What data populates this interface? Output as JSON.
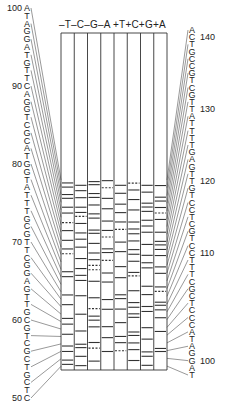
{
  "header": {
    "lane_labels": [
      "-T",
      "-C",
      "-G",
      "-A",
      "+T",
      "+C",
      "+G",
      "+A"
    ],
    "text": "–T–C–G–A +T+C+G+A"
  },
  "left_sequence": {
    "start_position": 100,
    "end_position": 50,
    "bases": [
      "A",
      "T",
      "A",
      "G",
      "G",
      "A",
      "T",
      "G",
      "T",
      "T",
      "C",
      "A",
      "G",
      "G",
      "T",
      "C",
      "G",
      "C",
      "A",
      "T",
      "G",
      "G",
      "T",
      "A",
      "T",
      "T",
      "T",
      "G",
      "C",
      "G",
      "T",
      "T",
      "C",
      "G",
      "G",
      "A",
      "G",
      "T",
      "T",
      "G",
      "C",
      "G",
      "T",
      "C",
      "G",
      "C",
      "T",
      "G",
      "C",
      "T",
      "C"
    ],
    "labels": [
      {
        "text": "100",
        "index": 0
      },
      {
        "text": "90",
        "index": 10
      },
      {
        "text": "80",
        "index": 20
      },
      {
        "text": "70",
        "index": 30
      },
      {
        "text": "60",
        "index": 40
      },
      {
        "text": "50",
        "index": 50
      }
    ]
  },
  "right_sequence": {
    "start_position": 141,
    "end_position": 97,
    "bases": [
      "A",
      "C",
      "T",
      "G",
      "C",
      "C",
      "G",
      "T",
      "C",
      "G",
      "T",
      "T",
      "A",
      "T",
      "T",
      "T",
      "T",
      "G",
      "A",
      "G",
      "T",
      "T",
      "G",
      "T",
      "C",
      "C",
      "T",
      "C",
      "G",
      "T",
      "C",
      "C",
      "T",
      "T",
      "T",
      "C",
      "G",
      "C",
      "T",
      "C",
      "C",
      "C",
      "A",
      "T",
      "A",
      "G",
      "G",
      "A",
      "T"
    ],
    "labels": [
      {
        "text": "140",
        "index": 1
      },
      {
        "text": "130",
        "index": 11
      },
      {
        "text": "120",
        "index": 21
      },
      {
        "text": "110",
        "index": 31
      },
      {
        "text": "100",
        "index": 46
      }
    ]
  },
  "gel": {
    "lanes": 8,
    "frame": {
      "x": 61,
      "y": 33,
      "width": 106,
      "height": 337
    },
    "bands_start_y": 180,
    "colors": {
      "line": "#333333",
      "background": "#ffffff"
    }
  }
}
